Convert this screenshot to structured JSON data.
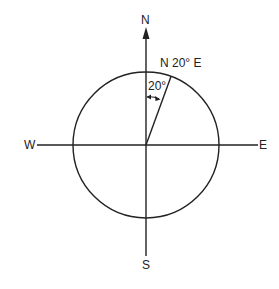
{
  "diagram": {
    "labels": {
      "north": "N",
      "south": "S",
      "east": "E",
      "west": "W",
      "bearing": "N 20° E",
      "angle": "20°"
    },
    "bearing": {
      "reference_direction": "N",
      "angle_degrees": 20,
      "toward": "E"
    },
    "colors": {
      "stroke": "#222222",
      "background": "#ffffff"
    }
  }
}
